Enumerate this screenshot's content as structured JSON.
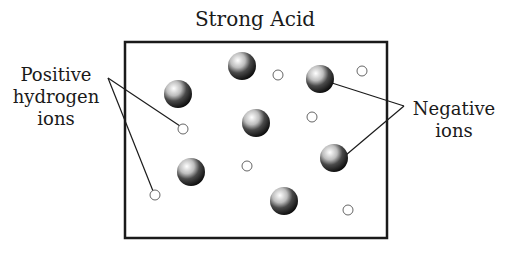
{
  "title": "Strong Acid",
  "labels": {
    "positive": [
      "Positive",
      "hydrogen",
      "ions"
    ],
    "negative": [
      "Negative",
      "ions"
    ]
  },
  "colors": {
    "line": "#1a1a1a",
    "background": "#ffffff",
    "sphere_light": "#f2f2f2",
    "sphere_dark": "#111111"
  },
  "container_box": {
    "x": 125,
    "y": 42,
    "width": 262,
    "height": 196
  },
  "negative_ions": [
    {
      "cx": 242,
      "cy": 66
    },
    {
      "cx": 178,
      "cy": 94
    },
    {
      "cx": 320,
      "cy": 79
    },
    {
      "cx": 256,
      "cy": 123
    },
    {
      "cx": 191,
      "cy": 172
    },
    {
      "cx": 334,
      "cy": 158
    },
    {
      "cx": 284,
      "cy": 201
    }
  ],
  "positive_hydrogen_ions": [
    {
      "cx": 278,
      "cy": 75
    },
    {
      "cx": 362,
      "cy": 71
    },
    {
      "cx": 183,
      "cy": 129
    },
    {
      "cx": 312,
      "cy": 117
    },
    {
      "cx": 247,
      "cy": 166
    },
    {
      "cx": 155,
      "cy": 195
    },
    {
      "cx": 348,
      "cy": 210
    }
  ]
}
